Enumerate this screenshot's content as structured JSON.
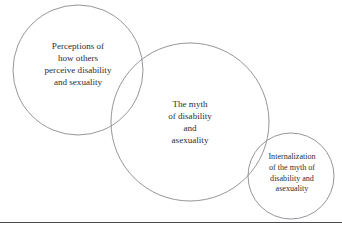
{
  "figure": {
    "background_color": "#ffffff",
    "stroke_color": "#8a8a90",
    "text_color": "#2e2e33",
    "rule_color": "#4a4a4f"
  },
  "diagram": {
    "type": "venn",
    "circles": [
      {
        "id": "perceptions",
        "name": "perceptions-circle",
        "label": "Perceptions of\nhow others\nperceive disability\nand sexuality",
        "cx": 78,
        "cy": 70,
        "r": 65
      },
      {
        "id": "myth",
        "name": "myth-circle",
        "label": "The myth\nof disability\nand\nasexuality",
        "cx": 190,
        "cy": 122,
        "r": 79
      },
      {
        "id": "internalization",
        "name": "internalization-circle",
        "label": "Internalization\nof the myth of\ndisability and\nasexuality",
        "cx": 291,
        "cy": 176,
        "r": 43
      }
    ]
  },
  "footer": {
    "rule_visible": true
  }
}
